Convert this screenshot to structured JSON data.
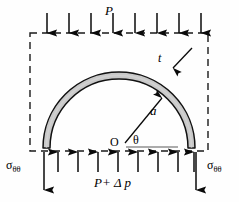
{
  "figure": {
    "domain": "Diagram",
    "width": 239,
    "height": 202,
    "background_color": "#fefefe",
    "line_color": "#000000",
    "band_fill_color": "#c8c8c8",
    "band_stroke_color": "#000000",
    "dashed_boundary_color": "#1a1a1a"
  },
  "labels": {
    "top_pressure": "P",
    "thickness": "t",
    "radius": "a",
    "origin": "O",
    "angle": "θ",
    "bottom_pressure": "P+ Δ p",
    "bottom_pressure_parts": {
      "p": "P",
      "plus": "+",
      "delta": "Δ",
      "dp": "p"
    },
    "sigma_left": {
      "symbol": "σ",
      "subscript": "θθ"
    },
    "sigma_right": {
      "symbol": "σ",
      "subscript": "θθ"
    }
  },
  "geometry": {
    "center": {
      "x": 119,
      "y": 148
    },
    "outer_radius": 76,
    "inner_radius": 69,
    "band_thickness": 7,
    "dashed_rect": {
      "x": 30,
      "y": 33,
      "width": 178,
      "height": 118
    },
    "baseline_y": 147,
    "baseline_x_end": 178,
    "radius_arrow_angle_deg": 52,
    "top_arrow_count": 8,
    "bottom_arrow_count": 8,
    "sigma_arrow_left_x": 44,
    "sigma_arrow_right_x": 196,
    "sigma_arrow_top_y": 152,
    "sigma_arrow_bottom_y": 190
  },
  "arrows": {
    "top": {
      "direction": "down",
      "label": "P",
      "count": 8,
      "x_positions": [
        47,
        69,
        91,
        113,
        135,
        157,
        179,
        201
      ],
      "tail_y": 13,
      "head_y": 33
    },
    "bottom": {
      "direction": "up",
      "label": "P+ Δ p",
      "count": 8,
      "x_positions": [
        58,
        79,
        100,
        121,
        142,
        163,
        184,
        195
      ],
      "tail_y": 172,
      "head_y": 152
    },
    "radius": {
      "label": "a",
      "from": "O",
      "to": "arch-inner-surface"
    },
    "thickness": {
      "label": "t",
      "points_to": "arch-band"
    }
  }
}
